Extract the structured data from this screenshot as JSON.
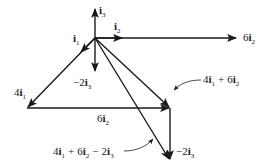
{
  "diagram": {
    "stroke_color": "#1a1a1a",
    "labels": {
      "i3": {
        "coef": "",
        "vec": "i",
        "sub": "3"
      },
      "i2": {
        "coef": "",
        "vec": "i",
        "sub": "2"
      },
      "i1": {
        "coef": "",
        "vec": "i",
        "sub": "1"
      },
      "six_i2_top": {
        "coef": "6",
        "vec": "i",
        "sub": "2"
      },
      "neg2_i3_mid": {
        "coef": "−2",
        "vec": "i",
        "sub": "3"
      },
      "four_i1": {
        "coef": "4",
        "vec": "i",
        "sub": "1"
      },
      "sum_4i1_6i2": {
        "a": "4",
        "asub": "1",
        "op": "+",
        "b": "6",
        "bsub": "2"
      },
      "six_i2_bottom": {
        "coef": "6",
        "vec": "i",
        "sub": "2"
      },
      "sum_total": {
        "a": "4",
        "asub": "1",
        "op1": "+",
        "b": "6",
        "bsub": "2",
        "op2": "−",
        "c": "2",
        "csub": "3"
      },
      "neg2_i3_right": {
        "coef": "−2",
        "vec": "i",
        "sub": "3"
      }
    },
    "vectors": [
      {
        "name": "i3",
        "from": [
          95,
          38
        ],
        "to": [
          95,
          8
        ]
      },
      {
        "name": "i2",
        "from": [
          95,
          38
        ],
        "to": [
          122,
          38
        ]
      },
      {
        "name": "i1",
        "from": [
          95,
          38
        ],
        "to": [
          80,
          52
        ]
      },
      {
        "name": "6i2",
        "from": [
          95,
          38
        ],
        "to": [
          236,
          38
        ]
      },
      {
        "name": "-2i3",
        "from": [
          95,
          38
        ],
        "to": [
          95,
          72
        ]
      },
      {
        "name": "4i1",
        "from": [
          95,
          38
        ],
        "to": [
          27,
          108
        ]
      },
      {
        "name": "6i2-shifted",
        "from": [
          27,
          108
        ],
        "to": [
          170,
          108
        ]
      },
      {
        "name": "4i1+6i2",
        "from": [
          95,
          38
        ],
        "to": [
          170,
          108
        ]
      },
      {
        "name": "-2i3-shifted",
        "from": [
          170,
          108
        ],
        "to": [
          170,
          160
        ]
      },
      {
        "name": "4i1+6i2-2i3",
        "from": [
          95,
          38
        ],
        "to": [
          170,
          160
        ]
      }
    ]
  }
}
